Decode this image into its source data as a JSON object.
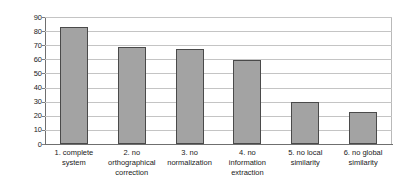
{
  "chart_data": {
    "type": "bar",
    "title": "",
    "subtitle": "",
    "xlabel": "",
    "ylabel": "Correct (%)",
    "ylim": [
      0,
      90
    ],
    "ytick_step": 10,
    "yticks": [
      "90",
      "80",
      "70",
      "60",
      "50",
      "40",
      "30",
      "20",
      "10",
      "0"
    ],
    "grid": true,
    "legend": false,
    "legend_position": "none",
    "categories": [
      "1. complete system",
      "2. no orthographical correction",
      "3. no normalization",
      "4. no information extraction",
      "5. no local similarity",
      "6. no global similarity"
    ],
    "category_lines": [
      [
        "1. complete",
        "system"
      ],
      [
        "2. no",
        "orthographical",
        "correction"
      ],
      [
        "3. no",
        "normalization"
      ],
      [
        "4. no",
        "information",
        "extraction"
      ],
      [
        "5. no local",
        "similarity"
      ],
      [
        "6. no global",
        "similarity"
      ]
    ],
    "values": [
      83,
      69,
      67,
      59.5,
      29.5,
      22.5
    ],
    "bar_fill_color": "#a3a3a3",
    "bar_border_color": "#4a4a4a",
    "gridline_color": "#c4c4c4",
    "axis_color": "#6f6f6f"
  }
}
